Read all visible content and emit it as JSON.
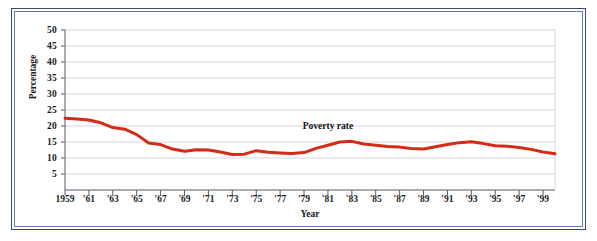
{
  "figure": {
    "frame_color": "#3a4a78",
    "background": "#ffffff"
  },
  "axes": {
    "y_title": "Percentage",
    "x_title": "Year",
    "y_ticks": [
      "5",
      "10",
      "15",
      "20",
      "25",
      "30",
      "35",
      "40",
      "45",
      "50"
    ],
    "x_ticks": [
      "1959",
      "'61",
      "'63",
      "'65",
      "'67",
      "'69",
      "'71",
      "'73",
      "'75",
      "'77",
      "'79",
      "'81",
      "'83",
      "'85",
      "'87",
      "'89",
      "'91",
      "'93",
      "'95",
      "'97",
      "'99"
    ]
  },
  "annotations": {
    "series_label": "Poverty rate"
  },
  "chart_data": {
    "type": "line",
    "title": "",
    "subtitle": "",
    "xlabel": "Year",
    "ylabel": "Percentage",
    "xlim": [
      1959,
      2000
    ],
    "ylim": [
      0,
      50
    ],
    "grid": true,
    "grid_axis": "y",
    "legend": false,
    "annotations": [
      {
        "text": "Poverty rate",
        "x": 1981,
        "y": 19.5
      }
    ],
    "x_tick_values": [
      1959,
      1961,
      1963,
      1965,
      1967,
      1969,
      1971,
      1973,
      1975,
      1977,
      1979,
      1981,
      1983,
      1985,
      1987,
      1989,
      1991,
      1993,
      1995,
      1997,
      1999
    ],
    "x_tick_labels": [
      "1959",
      "'61",
      "'63",
      "'65",
      "'67",
      "'69",
      "'71",
      "'73",
      "'75",
      "'77",
      "'79",
      "'81",
      "'83",
      "'85",
      "'87",
      "'89",
      "'91",
      "'93",
      "'95",
      "'97",
      "'99"
    ],
    "y_tick_values": [
      5,
      10,
      15,
      20,
      25,
      30,
      35,
      40,
      45,
      50
    ],
    "series": [
      {
        "name": "Poverty rate",
        "color": "#d42b16",
        "line_width": 3,
        "x": [
          1959,
          1960,
          1961,
          1962,
          1963,
          1964,
          1965,
          1966,
          1967,
          1968,
          1969,
          1970,
          1971,
          1972,
          1973,
          1974,
          1975,
          1976,
          1977,
          1978,
          1979,
          1980,
          1981,
          1982,
          1983,
          1984,
          1985,
          1986,
          1987,
          1988,
          1989,
          1990,
          1991,
          1992,
          1993,
          1994,
          1995,
          1996,
          1997,
          1998,
          1999,
          2000
        ],
        "values": [
          22.4,
          22.2,
          21.9,
          21.0,
          19.5,
          19.0,
          17.3,
          14.7,
          14.2,
          12.8,
          12.1,
          12.6,
          12.5,
          11.9,
          11.1,
          11.2,
          12.3,
          11.8,
          11.6,
          11.4,
          11.7,
          13.0,
          14.0,
          15.0,
          15.2,
          14.4,
          14.0,
          13.6,
          13.4,
          13.0,
          12.8,
          13.5,
          14.2,
          14.8,
          15.1,
          14.5,
          13.8,
          13.7,
          13.3,
          12.7,
          11.9,
          11.3
        ]
      }
    ]
  }
}
